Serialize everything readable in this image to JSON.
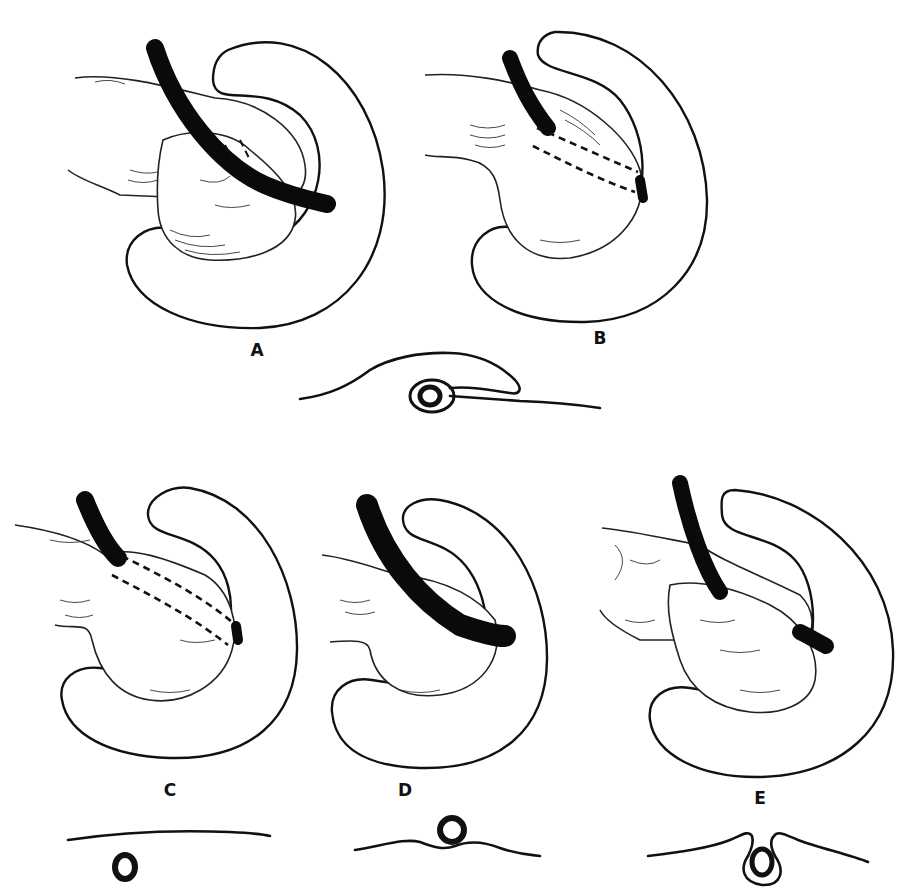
{
  "figure": {
    "panels": [
      {
        "id": "A",
        "label": "A",
        "label_pos": [
          257,
          352
        ]
      },
      {
        "id": "B",
        "label": "B",
        "label_pos": [
          600,
          340
        ]
      },
      {
        "id": "C",
        "label": "C",
        "label_pos": [
          170,
          792
        ]
      },
      {
        "id": "D",
        "label": "D",
        "label_pos": [
          405,
          792
        ]
      },
      {
        "id": "E",
        "label": "E",
        "label_pos": [
          760,
          800
        ]
      }
    ],
    "cross_sections": [
      {
        "id": "AB-section",
        "description": "duct loop beneath flap of tissue"
      },
      {
        "id": "C-section",
        "description": "duct below flat surface"
      },
      {
        "id": "D-section",
        "description": "duct above surface"
      },
      {
        "id": "E-section",
        "description": "duct enclosed in invaginated surface"
      }
    ],
    "colors": {
      "ink": "#111111",
      "paper": "#ffffff"
    }
  }
}
